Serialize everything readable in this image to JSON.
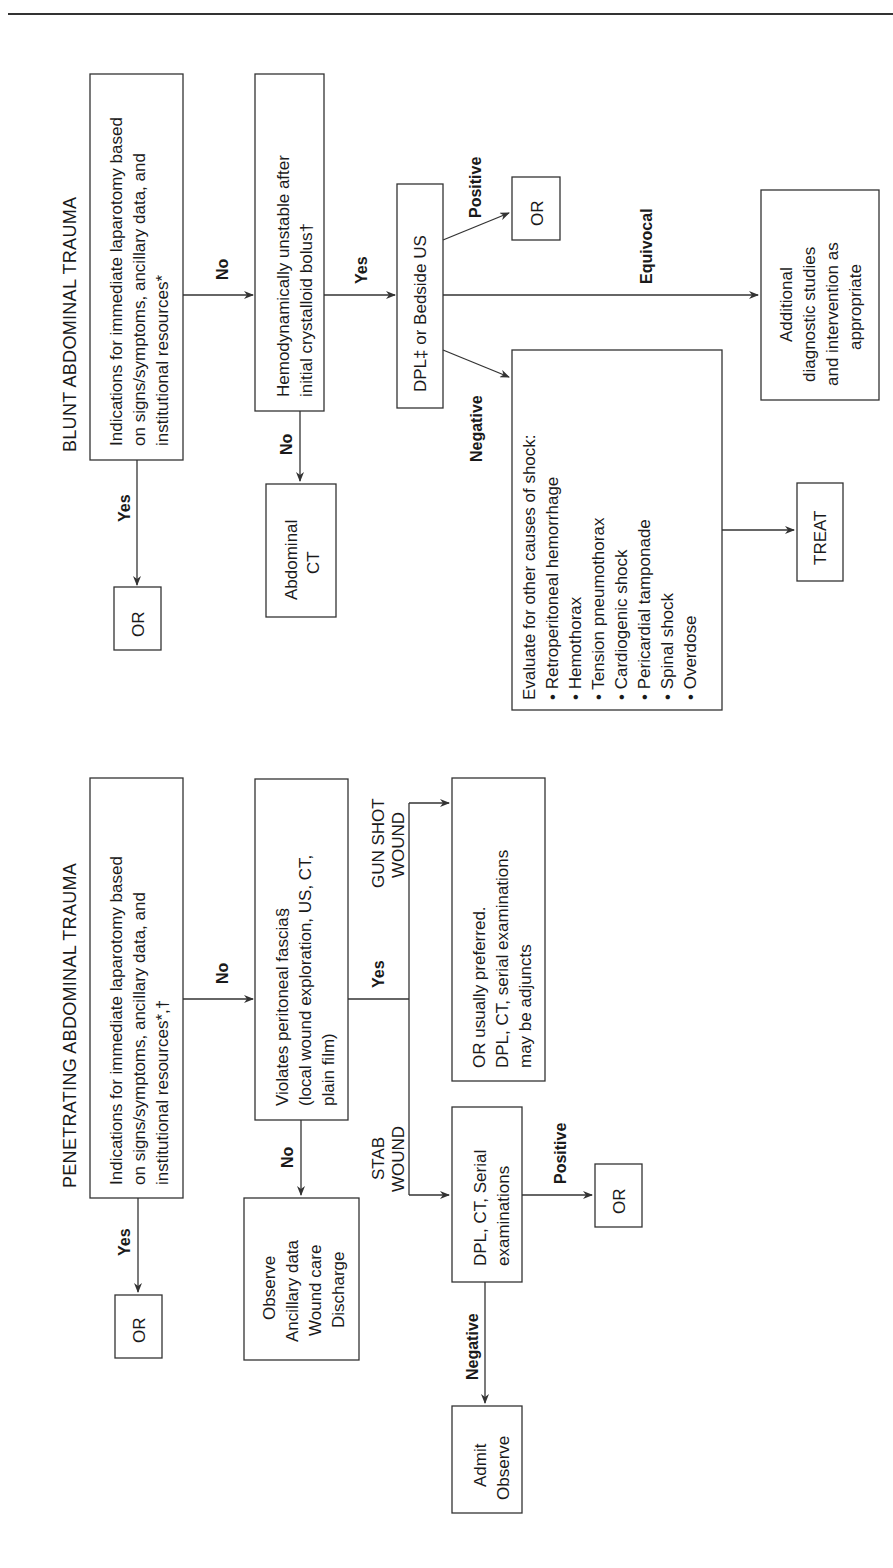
{
  "blunt": {
    "title": "BLUNT ABDOMINAL TRAUMA",
    "indications": [
      "Indications for immediate laparotomy based",
      "on signs/symptoms, ancillary data, and",
      "institutional resources*"
    ],
    "yes_label": "Yes",
    "no_label": "No",
    "or_label": "OR",
    "hemodynamic": [
      "Hemodynamically unstable after",
      "initial crystalloid bolus†"
    ],
    "no2_label": "No",
    "abdominal_ct": [
      "Abdominal",
      "CT"
    ],
    "yes2_label": "Yes",
    "dpl": "DPL‡ or Bedside US",
    "positive_label": "Positive",
    "or2_label": "OR",
    "equivocal_label": "Equivocal",
    "additional": [
      "Additional",
      "diagnostic studies",
      "and intervention as",
      "appropriate"
    ],
    "negative_label": "Negative",
    "evaluate_heading": "Evaluate for other causes of shock:",
    "evaluate_items": [
      "Retroperitoneal hemorrhage",
      "Hemothorax",
      "Tension pneumothorax",
      "Cardiogenic shock",
      "Pericardial tamponade",
      "Spinal shock",
      "Overdose"
    ],
    "treat": "TREAT"
  },
  "penetrating": {
    "title": "PENETRATING ABDOMINAL TRAUMA",
    "indications": [
      "Indications for immediate laparotomy based",
      "on signs/symptoms, ancillary data, and",
      "institutional resources*,†"
    ],
    "yes_label": "Yes",
    "or_label": "OR",
    "no_label": "No",
    "violates": [
      "Violates peritoneal fascia§",
      "(local wound exploration, US, CT,",
      "plain film)"
    ],
    "no2_label": "No",
    "observe": [
      "Observe",
      "Ancillary data",
      "Wound care",
      "Discharge"
    ],
    "yes2_label": "Yes",
    "gunshot_label": [
      "GUN SHOT",
      "WOUND"
    ],
    "gunshot_box": [
      "OR usually preferred.",
      "DPL, CT, serial examinations",
      "may be adjuncts"
    ],
    "stab_label": [
      "STAB",
      "WOUND"
    ],
    "dpl_ct": [
      "DPL, CT, Serial",
      "examinations"
    ],
    "positive_label": "Positive",
    "or2_label": "OR",
    "negative_label": "Negative",
    "admit": [
      "Admit",
      "Observe"
    ]
  }
}
